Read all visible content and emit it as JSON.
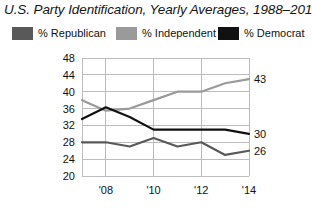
{
  "chart_data": {
    "type": "line",
    "title": "U.S. Party Identification, Yearly Averages, 1988–2014",
    "xlabel": "",
    "ylabel": "",
    "x": [
      2007,
      2008,
      2009,
      2010,
      2011,
      2012,
      2013,
      2014
    ],
    "xlim": [
      2007,
      2014
    ],
    "ylim": [
      20,
      48
    ],
    "yticks": [
      20,
      24,
      28,
      32,
      36,
      40,
      44,
      48
    ],
    "ytick_labels": [
      "20",
      "24",
      "28",
      "32",
      "36",
      "40",
      "44",
      "48"
    ],
    "xticks": [
      2008,
      2010,
      2012,
      2014
    ],
    "xtick_labels": [
      "'08",
      "'10",
      "'12",
      "'14"
    ],
    "grid": true,
    "grid_axis": "both",
    "legend_position": "top",
    "series": [
      {
        "name": "% Republican",
        "color": "#595959",
        "values": [
          28,
          28,
          27,
          29,
          27,
          28,
          25,
          26
        ],
        "end_label": "26"
      },
      {
        "name": "% Independent",
        "color": "#9a9a9a",
        "values": [
          38,
          35.5,
          36,
          38,
          40,
          40,
          42,
          43
        ],
        "end_label": "43"
      },
      {
        "name": "% Democrat",
        "color": "#111111",
        "values": [
          33.5,
          36.3,
          34,
          31,
          31,
          31,
          31,
          30
        ],
        "end_label": "30"
      }
    ]
  },
  "legend": {
    "items": [
      {
        "label": "% Republican",
        "color": "#595959"
      },
      {
        "label": "% Independent",
        "color": "#9a9a9a"
      },
      {
        "label": "% Democrat",
        "color": "#111111"
      }
    ]
  },
  "colors": {
    "republican": "#595959",
    "independent": "#9a9a9a",
    "democrat": "#111111",
    "grid": "#bdbdbd",
    "axis": "#8c8c8c",
    "text": "#111111",
    "background": "#ffffff"
  }
}
